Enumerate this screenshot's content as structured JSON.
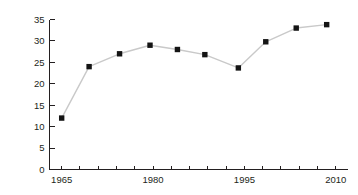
{
  "chart_data": {
    "type": "line",
    "title": "",
    "subtitle": "",
    "xlabel": "",
    "ylabel": "",
    "x": [
      1965,
      1968,
      1971,
      1974,
      1977,
      1980,
      1983,
      1986,
      1989,
      1992,
      1995,
      1998,
      2001,
      2004,
      2007,
      2010
    ],
    "series": [
      {
        "name": "series-1",
        "x": [
          1965,
          1969.5,
          1974.5,
          1979.5,
          1984,
          1988.5,
          1994,
          1998.5,
          2003.5,
          2008.5
        ],
        "values": [
          12.0,
          24.0,
          27.0,
          29.0,
          28.0,
          26.8,
          23.7,
          29.8,
          33.0,
          33.8
        ]
      }
    ],
    "xlim": [
      1963,
      2012
    ],
    "ylim": [
      0,
      35
    ],
    "ytick_values": [
      0,
      5,
      10,
      15,
      20,
      25,
      30,
      35
    ],
    "ytick_labels": [
      "0",
      "5",
      "10",
      "15",
      "20",
      "25",
      "30",
      "35"
    ],
    "xtick_values": [
      1965,
      1968,
      1971,
      1974,
      1977,
      1980,
      1983,
      1986,
      1989,
      1992,
      1995,
      1998,
      2001,
      2004,
      2007,
      2010
    ],
    "xtick_labels_shown": [
      "1965",
      "1980",
      "1995",
      "2010"
    ],
    "xtick_labeled_values": [
      1965,
      1980,
      1995,
      2010
    ],
    "grid": false,
    "legend": false,
    "legend_position": "none",
    "marker": "square",
    "marker_color": "#141414",
    "line_color": "#c9c9c9",
    "axis_color": "#231f20",
    "background_color": "#ffffff"
  },
  "axes": {
    "y": {
      "labels": [
        "35",
        "30",
        "25",
        "20",
        "15",
        "10",
        "5",
        "0"
      ]
    },
    "x": {
      "labels": [
        "1965",
        "1980",
        "1995",
        "2010"
      ]
    }
  }
}
